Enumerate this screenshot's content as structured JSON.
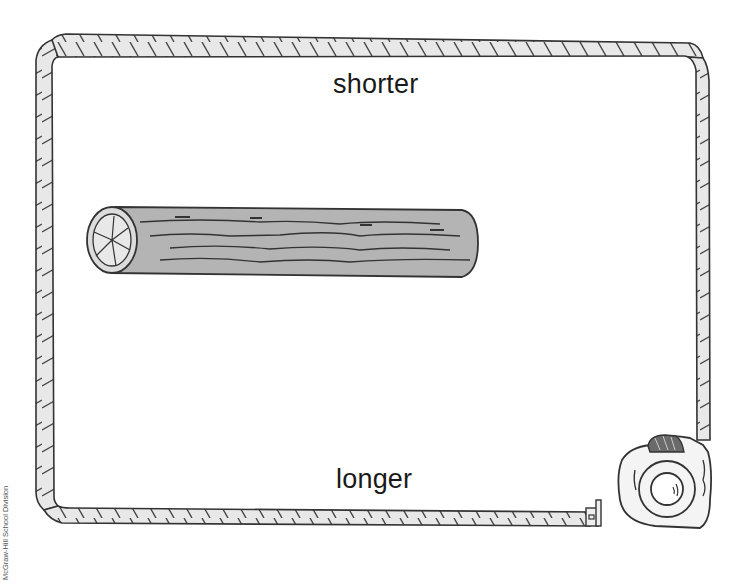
{
  "illustration": {
    "top_label": "shorter",
    "bottom_label": "longer",
    "credit": "McGraw-Hill School Division",
    "objects": [
      "measuring-tape-border",
      "log",
      "tape-measure-case"
    ]
  },
  "colors": {
    "background": "#ffffff",
    "ink": "#333333",
    "tape_fill": "#e6e6e6",
    "log_fill": "#b4b4b4",
    "log_end_fill": "#dcdcdc",
    "text": "#1a1a1a"
  }
}
